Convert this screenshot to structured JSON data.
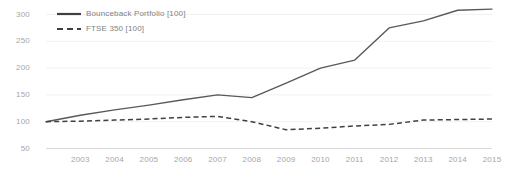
{
  "chart_data": {
    "type": "line",
    "title": "",
    "xlabel": "",
    "ylabel": "",
    "grid": true,
    "legend_position": "top-left",
    "x": [
      2002,
      2003,
      2004,
      2005,
      2006,
      2007,
      2008,
      2009,
      2010,
      2011,
      2012,
      2013,
      2014,
      2015
    ],
    "xlim": [
      2002,
      2015
    ],
    "ylim": [
      50,
      310
    ],
    "yticks": [
      300,
      250,
      200,
      150,
      100,
      50
    ],
    "xticks": [
      "2003",
      "2004",
      "2005",
      "2006",
      "2007",
      "2008",
      "2009",
      "2010",
      "2011",
      "2012",
      "2013",
      "2014",
      "2015"
    ],
    "series": [
      {
        "name": "Bounceback Portfolio [100]",
        "style": "solid",
        "color": "#595959",
        "values": [
          100,
          112,
          122,
          131,
          141,
          150,
          145,
          172,
          200,
          215,
          275,
          288,
          308,
          310
        ]
      },
      {
        "name": "FTSE 350 [100]",
        "style": "dashed",
        "color": "#404040",
        "values": [
          100,
          101,
          103,
          105,
          108,
          110,
          100,
          85,
          88,
          92,
          95,
          103,
          104,
          105
        ]
      }
    ]
  },
  "axis": {
    "y_tick_labels": [
      "300",
      "250",
      "200",
      "150",
      "100",
      "50"
    ],
    "x_tick_labels": [
      "2003",
      "2004",
      "2005",
      "2006",
      "2007",
      "2008",
      "2009",
      "2010",
      "2011",
      "2012",
      "2013",
      "2014",
      "2015"
    ]
  },
  "legend": {
    "items": [
      {
        "label": "Bounceback Portfolio [100]",
        "style": "solid"
      },
      {
        "label": "FTSE 350 [100]",
        "style": "dashed"
      }
    ]
  },
  "colors": {
    "series_solid": "#595959",
    "series_dashed": "#404040",
    "gridline": "#f2f2f2",
    "axis_line": "#d9d9d9",
    "tick_text": "#a6a6a6",
    "legend_text": "#7f7f7f",
    "background": "#ffffff"
  }
}
